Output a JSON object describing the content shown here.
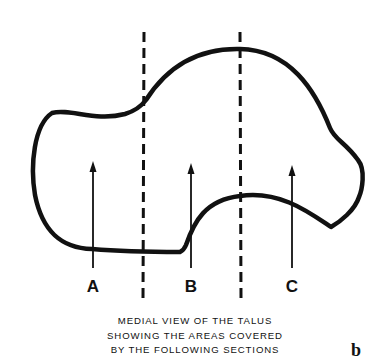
{
  "figure": {
    "title": "Medial view of the talus",
    "panel_label": "b",
    "caption_lines": [
      "MEDIAL VIEW OF THE TALUS",
      "SHOWING THE AREAS COVERED",
      "BY THE FOLLOWING SECTIONS"
    ],
    "section_labels": [
      "A",
      "B",
      "C"
    ],
    "colors": {
      "ink": "#111111",
      "background": "#ffffff"
    }
  }
}
